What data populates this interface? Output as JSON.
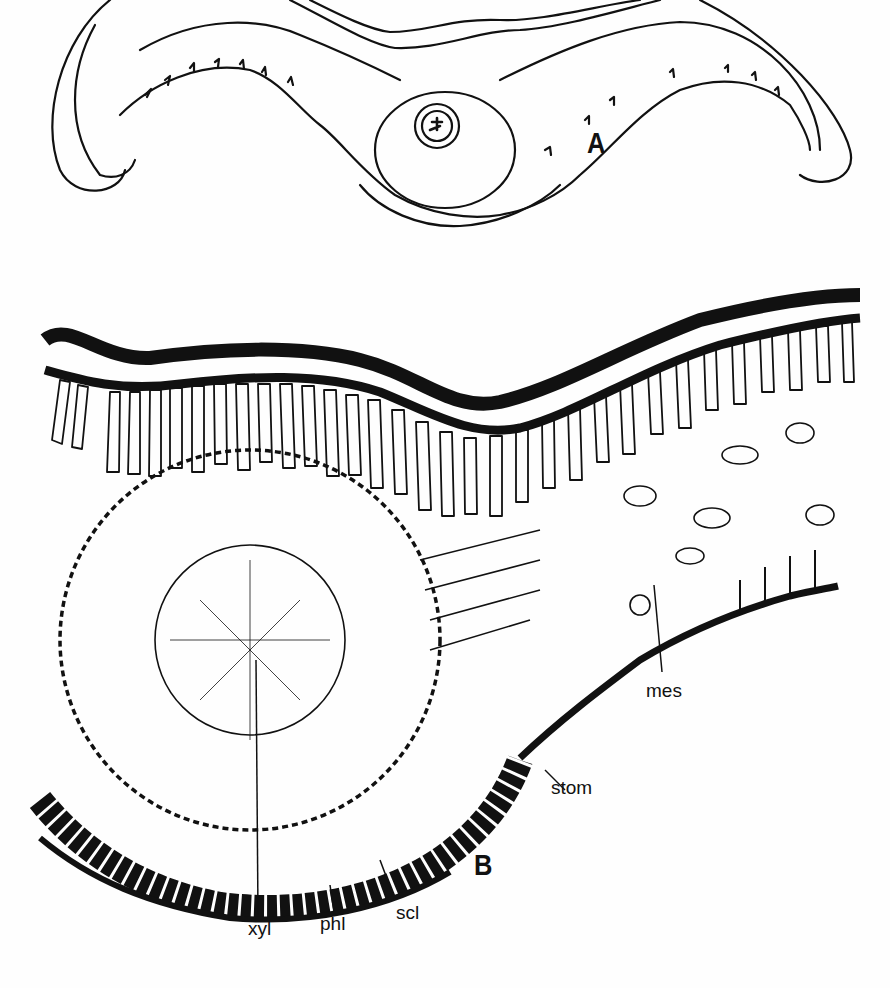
{
  "figure": {
    "panels": [
      {
        "id": "A",
        "label": "A",
        "description": "Whole leaf transverse section outline with central midrib vascular bundle"
      },
      {
        "id": "B",
        "label": "B",
        "description": "Detailed cellular cross-section of midrib region"
      }
    ],
    "tissue_labels": [
      {
        "key": "mes",
        "text": "mes"
      },
      {
        "key": "stom",
        "text": "stom"
      },
      {
        "key": "xyl",
        "text": "xyl"
      },
      {
        "key": "phl",
        "text": "phl"
      },
      {
        "key": "scl",
        "text": "scl"
      }
    ],
    "colors": {
      "ink": "#111111",
      "paper": "#fefefe"
    }
  }
}
